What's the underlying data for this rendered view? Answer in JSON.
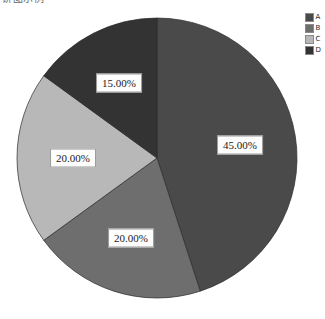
{
  "chart_data": {
    "type": "pie",
    "title": "饼图示例",
    "title_note": "title row is cropped by the top edge of the screenshot",
    "categories": [
      "A",
      "B",
      "C",
      "D"
    ],
    "values": [
      45,
      20,
      20,
      15
    ],
    "value_unit": "%",
    "data_labels": [
      "45.00%",
      "20.00%",
      "20.00%",
      "15.00%"
    ],
    "colors": [
      "#4a4a4a",
      "#6e6e6e",
      "#b8b8b8",
      "#333333"
    ],
    "start_angle_deg": 0,
    "direction": "clockwise",
    "legend_position": "top-right",
    "legend_entries": [
      {
        "label": "A",
        "color": "#4a4a4a",
        "value": 45,
        "data_label": "45.00%"
      },
      {
        "label": "B",
        "color": "#6e6e6e",
        "value": 20,
        "data_label": "20.00%"
      },
      {
        "label": "C",
        "color": "#b8b8b8",
        "value": 20,
        "data_label": "20.00%"
      },
      {
        "label": "D",
        "color": "#333333",
        "value": 15,
        "data_label": "15.00%"
      }
    ],
    "xlabel": "",
    "ylabel": "",
    "grid": false,
    "geometry": {
      "cx": 157,
      "cy": 158,
      "r": 140
    }
  }
}
